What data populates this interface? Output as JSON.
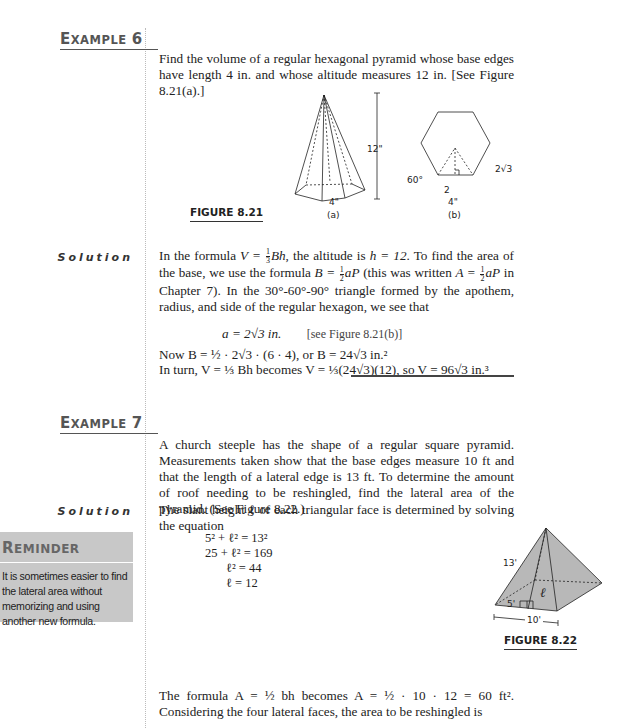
{
  "examples": [
    {
      "heading_first": "E",
      "heading_rest": "XAMPLE",
      "number": "6",
      "problem": "Find the volume of a regular hexagonal pyramid whose base edges have length 4 in. and whose altitude measures 12 in. [See Figure 8.21(a).]",
      "figure": {
        "label": "FIGURE 8.21",
        "part_a": {
          "caption": "(a)",
          "height_label": "12\"",
          "edge_label": "4\""
        },
        "part_b": {
          "caption": "(b)",
          "angle_label": "60°",
          "apothem_label": "2√3",
          "half_label": "2",
          "side_label": "4\""
        }
      },
      "solution_label": "Solution",
      "solution": {
        "line1_a": "In the formula ",
        "line1_b": ", the altitude is ",
        "line1_c": ". To find the area of the base, we use the formula ",
        "line1_d": " (this was written ",
        "line1_e": " in Chapter 7). In the 30°-60°-90° triangle formed by the apothem, radius, and side of the regular hexagon, we see that",
        "formula_V": "V = ",
        "formula_Bh": "Bh",
        "h_eq": "h = 12",
        "formula_B": "B = ",
        "formula_A": "A = ",
        "aP": "aP",
        "display_eq": "a = 2√3 in.",
        "display_ref": "[see Figure 8.21(b)]",
        "now_line": "Now B = ½ · 2√3 · (6 · 4), or B = 24√3 in.²",
        "turn_line": "In turn, V = ⅓ Bh becomes V = ⅓(24√3)(12), so V = 96√3 in.³"
      }
    },
    {
      "heading_first": "E",
      "heading_rest": "XAMPLE",
      "number": "7",
      "problem": "A church steeple has the shape of a regular square pyramid. Measurements taken show that the base edges measure 10 ft and that the length of a lateral edge is 13 ft. To determine the amount of roof needing to be reshingled, find the lateral area of the pyramid. (See Figure 8.22.)",
      "solution_label": "Solution",
      "solution_intro": "The slant height ℓ of each triangular face is determined by solving the equation",
      "equations": [
        "5² + ℓ² = 13²",
        "25 + ℓ² = 169",
        "ℓ² = 44",
        "ℓ = 12"
      ],
      "figure": {
        "label": "FIGURE 8.22",
        "lateral_edge": "13'",
        "slant": "ℓ",
        "half_base": "5'",
        "base": "10'"
      },
      "closing": "The formula A = ½ bh becomes A = ½ · 10 · 12 = 60 ft². Considering the four lateral faces, the area to be reshingled is"
    }
  ],
  "reminder": {
    "title_first": "R",
    "title_rest": "EMINDER",
    "text": "It is sometimes easier to find the lateral area without memorizing and using another new formula."
  },
  "colors": {
    "heading": "#555555",
    "reminder_bg": "#c8c8c8",
    "pyramid_fill": "#b8b8b8"
  }
}
